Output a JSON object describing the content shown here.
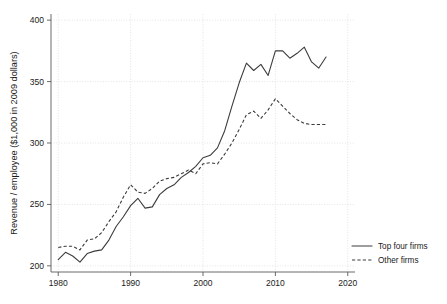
{
  "chart_data": {
    "type": "line",
    "title": "",
    "xlabel": "",
    "ylabel": "Revenue / employee ($1,000 in 2009 dollars)",
    "xlim": [
      1979,
      2021
    ],
    "ylim": [
      195,
      405
    ],
    "xticks": [
      1980,
      1990,
      2000,
      2010,
      2020
    ],
    "xtick_labels": [
      "1980",
      "1990",
      "2000",
      "2010",
      "2020"
    ],
    "yticks": [
      200,
      250,
      300,
      350,
      400
    ],
    "ytick_labels": [
      "200",
      "250",
      "300",
      "350",
      "400"
    ],
    "grid": true,
    "legend_position": "right",
    "x": [
      1980,
      1981,
      1982,
      1983,
      1984,
      1985,
      1986,
      1987,
      1988,
      1989,
      1990,
      1991,
      1992,
      1993,
      1994,
      1995,
      1996,
      1997,
      1998,
      1999,
      2000,
      2001,
      2002,
      2003,
      2004,
      2005,
      2006,
      2007,
      2008,
      2009,
      2010,
      2011,
      2012,
      2013,
      2014,
      2015,
      2016,
      2017
    ],
    "series": [
      {
        "name": "Top four firms",
        "style": "solid",
        "values": [
          205,
          211,
          208,
          203,
          210,
          212,
          213,
          221,
          232,
          240,
          249,
          255,
          247,
          248,
          258,
          263,
          266,
          272,
          276,
          281,
          288,
          290,
          296,
          310,
          330,
          349,
          365,
          359,
          364,
          355,
          375,
          375,
          369,
          373,
          378,
          366,
          361,
          370
        ]
      },
      {
        "name": "Other firms",
        "style": "dashed",
        "values": [
          215,
          216,
          216,
          213,
          221,
          222,
          227,
          236,
          244,
          256,
          266,
          260,
          259,
          263,
          269,
          271,
          272,
          275,
          278,
          275,
          283,
          284,
          283,
          291,
          300,
          311,
          323,
          326,
          320,
          327,
          336,
          330,
          324,
          319,
          316,
          315,
          315,
          315
        ]
      }
    ]
  },
  "axis": {
    "y_title": "Revenue / employee ($1,000 in 2009 dollars)"
  },
  "legend": {
    "entries": [
      {
        "label": "Top four firms",
        "style": "solid"
      },
      {
        "label": "Other firms",
        "style": "dashed"
      }
    ]
  },
  "colors": {
    "line": "#3c3c3c",
    "grid": "#c8c8c8",
    "axis": "#5a5a5a",
    "text": "#1a1a1a",
    "background": "#ffffff"
  }
}
